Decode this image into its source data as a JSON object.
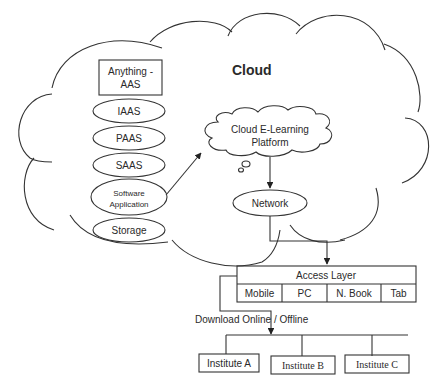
{
  "cloud": {
    "title": "Cloud"
  },
  "service_stack": {
    "header_line1": "Anything -",
    "header_line2": "AAS",
    "items": [
      {
        "label": "IAAS"
      },
      {
        "label": "PAAS"
      },
      {
        "label": "SAAS"
      },
      {
        "label_line1": "Software",
        "label_line2": "Application"
      },
      {
        "label": "Storage"
      }
    ]
  },
  "platform": {
    "line1": "Cloud E-Learning",
    "line2": "Platform"
  },
  "network": {
    "label": "Network"
  },
  "access_layer": {
    "title": "Access Layer",
    "devices": [
      "Mobile",
      "PC",
      "N. Book",
      "Tab"
    ]
  },
  "download": {
    "label": "Download Online / Offline"
  },
  "institutes": [
    "Institute A",
    "Institute B",
    "Institute C"
  ]
}
